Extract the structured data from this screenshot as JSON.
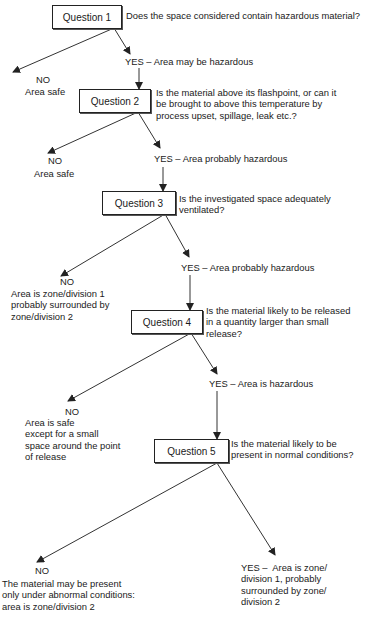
{
  "questions": [
    {
      "label": "Question 1",
      "text": "Does the space considered contain hazardous material?"
    },
    {
      "label": "Question 2",
      "text": "Is the material above its flashpoint, or can it\nbe brought to above this temperature by\nprocess upset, spillage, leak etc.?"
    },
    {
      "label": "Question 3",
      "text": "Is the investigated space adequately\nventilated?"
    },
    {
      "label": "Question 4",
      "text": "Is the material likely to be released\nin a quantity larger than small\nrelease?"
    },
    {
      "label": "Question 5",
      "text": "Is the material likely to be\npresent in normal conditions?"
    }
  ],
  "outcomes": {
    "q1_no": {
      "head": "NO",
      "body": "Area safe"
    },
    "q1_yes": "YES – Area may be hazardous",
    "q2_no": {
      "head": "NO",
      "body": "Area safe"
    },
    "q2_yes": "YES – Area probably hazardous",
    "q3_no": {
      "head": "NO",
      "body": "Area is zone/division 1\nprobably surrounded by\nzone/division 2"
    },
    "q3_yes": "YES – Area probably hazardous",
    "q4_no": {
      "head": "NO",
      "body": "Area is safe\nexcept for a small\nspace around the point\nof release"
    },
    "q4_yes": "YES – Area is hazardous",
    "q5_no": {
      "head": "NO",
      "body": "The material may be present\nonly under abnormal conditions:\narea is zone/division 2"
    },
    "q5_yes": "YES –  Area is zone/\ndivision 1, probably\nsurrounded by zone/\ndivision 2"
  }
}
